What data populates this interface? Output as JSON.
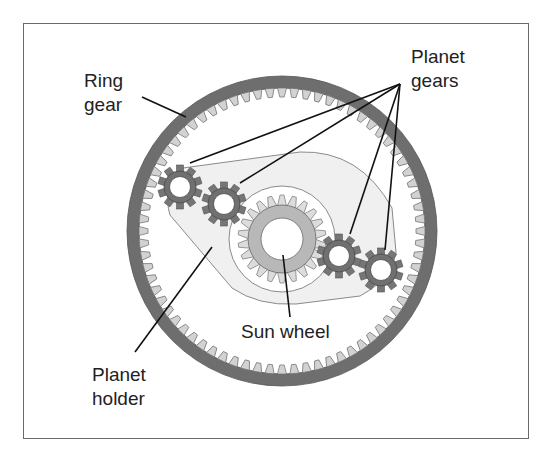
{
  "diagram": {
    "type": "planetary-gear-set",
    "colors": {
      "frame": "#6a6a6a",
      "ring_band": "#6e6e6e",
      "ring_teeth": "#d2d2d2",
      "planet_gear": "#707070",
      "sun_ring": "#b8b8b8",
      "sun_teeth": "#d8d8d8",
      "holder_fill": "#f0f0f0",
      "leader_line": "#111111",
      "text": "#222222"
    },
    "labels": {
      "ring_gear": {
        "line1": "Ring",
        "line2": "gear"
      },
      "planet_gears": {
        "line1": "Planet",
        "line2": "gears"
      },
      "sun_wheel": {
        "line1": "Sun wheel"
      },
      "planet_holder": {
        "line1": "Planet",
        "line2": "holder"
      }
    },
    "components": [
      {
        "name": "Ring gear",
        "count": 1
      },
      {
        "name": "Planet gears",
        "count": 4
      },
      {
        "name": "Sun wheel",
        "count": 1
      },
      {
        "name": "Planet holder",
        "count": 1
      }
    ]
  }
}
